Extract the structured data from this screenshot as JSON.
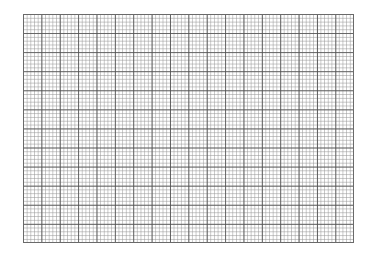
{
  "sheet": {
    "type": "graph-paper",
    "major_columns": 18,
    "major_rows": 12,
    "minor_divisions_per_major": 5,
    "colors": {
      "background": "#ffffff",
      "major_line": "#505050",
      "minor_line": "#b4b4b4",
      "border": "#6a6a6a"
    }
  }
}
